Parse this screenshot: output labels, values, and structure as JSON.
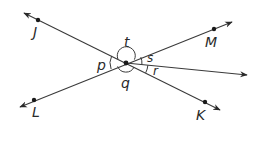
{
  "diagram": {
    "type": "intersecting-lines-angles",
    "stroke_color": "#3a3a3a",
    "center": {
      "x": 126,
      "y": 63
    },
    "lines": [
      {
        "name": "line-JK",
        "from": {
          "x": 24,
          "y": 13
        },
        "to": {
          "x": 220,
          "y": 110
        }
      },
      {
        "name": "line-LM",
        "from": {
          "x": 20,
          "y": 107
        },
        "to": {
          "x": 232,
          "y": 22
        }
      },
      {
        "name": "ray",
        "from": {
          "x": 126,
          "y": 63
        },
        "to": {
          "x": 247,
          "y": 75
        }
      }
    ],
    "points": [
      {
        "id": "J",
        "label": "J",
        "dot": {
          "x": 38,
          "y": 20
        },
        "text": {
          "x": 33,
          "y": 37
        }
      },
      {
        "id": "M",
        "label": "M",
        "dot": {
          "x": 214,
          "y": 29
        },
        "text": {
          "x": 205,
          "y": 47
        }
      },
      {
        "id": "L",
        "label": "L",
        "dot": {
          "x": 34,
          "y": 100
        },
        "text": {
          "x": 32,
          "y": 117
        }
      },
      {
        "id": "K",
        "label": "K",
        "dot": {
          "x": 205,
          "y": 102
        },
        "text": {
          "x": 196,
          "y": 120
        }
      }
    ],
    "angles": [
      {
        "id": "t",
        "label": "t",
        "text": {
          "x": 124,
          "y": 47
        }
      },
      {
        "id": "p",
        "label": "p",
        "text": {
          "x": 97,
          "y": 70
        }
      },
      {
        "id": "q",
        "label": "q",
        "text": {
          "x": 121,
          "y": 88
        }
      },
      {
        "id": "s",
        "label": "s",
        "text": {
          "x": 147,
          "y": 62
        }
      },
      {
        "id": "r",
        "label": "r",
        "text": {
          "x": 153,
          "y": 75
        }
      }
    ]
  }
}
